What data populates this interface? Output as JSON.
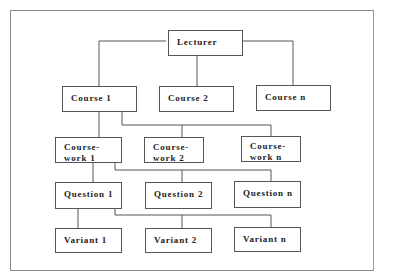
{
  "diagram": {
    "type": "hierarchy",
    "root": {
      "id": "lecturer",
      "label": "Lecturer"
    },
    "levels": [
      {
        "name": "courses",
        "nodes": [
          {
            "id": "course-1",
            "label": "Course 1"
          },
          {
            "id": "course-2",
            "label": "Course 2"
          },
          {
            "id": "course-n",
            "label": "Course n"
          }
        ]
      },
      {
        "name": "coursework",
        "nodes": [
          {
            "id": "coursework-1",
            "line1": "Course-",
            "line2": "work 1"
          },
          {
            "id": "coursework-2",
            "line1": "Course-",
            "line2": "work 2"
          },
          {
            "id": "coursework-n",
            "line1": "Course-",
            "line2": "work n"
          }
        ]
      },
      {
        "name": "questions",
        "nodes": [
          {
            "id": "question-1",
            "label": "Question 1"
          },
          {
            "id": "question-2",
            "label": "Question 2"
          },
          {
            "id": "question-n",
            "label": "Question n"
          }
        ]
      },
      {
        "name": "variants",
        "nodes": [
          {
            "id": "variant-1",
            "label": "Variant 1"
          },
          {
            "id": "variant-2",
            "label": "Variant 2"
          },
          {
            "id": "variant-n",
            "label": "Variant n"
          }
        ]
      }
    ],
    "edges": [
      [
        "lecturer",
        "course-1"
      ],
      [
        "lecturer",
        "course-2"
      ],
      [
        "lecturer",
        "course-n"
      ],
      [
        "course-1",
        "coursework-1"
      ],
      [
        "course-1",
        "coursework-2"
      ],
      [
        "course-1",
        "coursework-n"
      ],
      [
        "coursework-1",
        "question-1"
      ],
      [
        "coursework-1",
        "question-2"
      ],
      [
        "coursework-1",
        "question-n"
      ],
      [
        "question-1",
        "variant-1"
      ],
      [
        "question-1",
        "variant-2"
      ],
      [
        "question-1",
        "variant-n"
      ]
    ],
    "colors": {
      "line": "#555555",
      "frame": "#8a8a8a",
      "text": "#222222"
    }
  }
}
